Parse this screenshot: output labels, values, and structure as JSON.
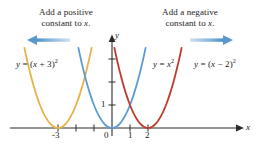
{
  "figure": {
    "background_color": "#ffffff",
    "annotations": [
      {
        "name": "left-annotation",
        "line1": "Add a positive",
        "line2": "constant to x.",
        "x": 28,
        "y": 8,
        "width": 76
      },
      {
        "name": "right-annotation",
        "line1": "Add a negative",
        "line2": "constant to x.",
        "x": 152,
        "y": 8,
        "width": 76
      }
    ],
    "arrows": [
      {
        "name": "left-arrow",
        "direction": "left",
        "color": "#6ba3d6",
        "x": 27,
        "y": 36,
        "length": 44
      },
      {
        "name": "right-arrow",
        "direction": "right",
        "color": "#6ba3d6",
        "x": 188,
        "y": 36,
        "length": 44
      }
    ]
  },
  "chart_data": {
    "type": "line",
    "title": "",
    "xlabel": "x",
    "ylabel": "y",
    "xlim": [
      -4.9,
      7.0
    ],
    "ylim": [
      -0.9,
      4.3
    ],
    "grid": false,
    "legend_position": "inline-curve-labels",
    "x_ticks": [
      -3,
      -2,
      -1,
      0,
      1,
      2
    ],
    "x_tick_labels": [
      "-3",
      "",
      "",
      "0",
      "1",
      "2"
    ],
    "y_ticks": [
      1,
      2,
      3
    ],
    "y_tick_labels": [
      "1",
      "",
      ""
    ],
    "origin_label": "0",
    "series": [
      {
        "name": "y = (x + 3)^2",
        "label_html": "<i>y</i> = (<i>x</i> + 3)<sup>2</sup>",
        "color": "#e8b14a",
        "vertex": [
          -3,
          0
        ],
        "equation": "y=(x+3)^2",
        "label_x": 16,
        "label_y": 62
      },
      {
        "name": "y = x^2",
        "label_html": "<i>y</i> = <i>x</i><sup>2</sup>",
        "color": "#5b9bd5",
        "vertex": [
          0,
          0
        ],
        "equation": "y=x^2",
        "label_x": 152,
        "label_y": 62
      },
      {
        "name": "y = (x - 2)^2",
        "label_html": "<i>y</i> = (<i>x</i> &minus; 2)<sup>2</sup>",
        "color": "#c0392b",
        "vertex": [
          2,
          0
        ],
        "equation": "y=(x-2)^2",
        "label_x": 197,
        "label_y": 62
      }
    ],
    "axis_color": "#2b2b2b"
  }
}
